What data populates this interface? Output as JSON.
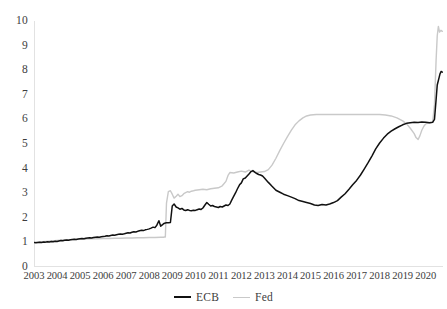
{
  "chart_data": {
    "type": "line",
    "title": "",
    "subtitle": "",
    "xlabel": "",
    "ylabel": "",
    "xlim": [
      2003.0,
      2020.75
    ],
    "ylim": [
      0,
      10
    ],
    "grid": false,
    "legend_position": "bottom-center",
    "y_ticks": [
      0,
      1,
      2,
      3,
      4,
      5,
      6,
      7,
      8,
      9,
      10
    ],
    "y_tick_labels": [
      "0",
      "1",
      "2",
      "3",
      "4",
      "5",
      "6",
      "7",
      "8",
      "9",
      "10"
    ],
    "x_ticks": [
      2003,
      2004,
      2005,
      2006,
      2007,
      2008,
      2009,
      2010,
      2011,
      2012,
      2013,
      2014,
      2015,
      2016,
      2017,
      2018,
      2019,
      2020
    ],
    "x_tick_labels": [
      "2003",
      "2004",
      "2005",
      "2006",
      "2007",
      "2008",
      "2009",
      "2010",
      "2011",
      "2012",
      "2013",
      "2014",
      "2015",
      "2016",
      "2017",
      "2018",
      "2019",
      "2020"
    ],
    "series": [
      {
        "name": "ECB",
        "color": "#111111",
        "line_width": 1.5,
        "x": [
          2003.0,
          2003.08,
          2003.17,
          2003.25,
          2003.33,
          2003.42,
          2003.5,
          2003.58,
          2003.67,
          2003.75,
          2003.83,
          2003.92,
          2004.0,
          2004.08,
          2004.17,
          2004.25,
          2004.33,
          2004.42,
          2004.5,
          2004.58,
          2004.67,
          2004.75,
          2004.83,
          2004.92,
          2005.0,
          2005.08,
          2005.17,
          2005.25,
          2005.33,
          2005.42,
          2005.5,
          2005.58,
          2005.67,
          2005.75,
          2005.83,
          2005.92,
          2006.0,
          2006.08,
          2006.17,
          2006.25,
          2006.33,
          2006.42,
          2006.5,
          2006.58,
          2006.67,
          2006.75,
          2006.83,
          2006.92,
          2007.0,
          2007.08,
          2007.17,
          2007.25,
          2007.33,
          2007.42,
          2007.5,
          2007.58,
          2007.67,
          2007.75,
          2007.83,
          2007.92,
          2008.0,
          2008.08,
          2008.17,
          2008.25,
          2008.33,
          2008.42,
          2008.5,
          2008.58,
          2008.62,
          2008.67,
          2008.7,
          2008.75,
          2008.83,
          2008.92,
          2009.0,
          2009.08,
          2009.17,
          2009.25,
          2009.33,
          2009.42,
          2009.5,
          2009.58,
          2009.67,
          2009.75,
          2009.83,
          2009.92,
          2010.0,
          2010.08,
          2010.17,
          2010.25,
          2010.33,
          2010.42,
          2010.5,
          2010.58,
          2010.67,
          2010.75,
          2010.83,
          2010.92,
          2011.0,
          2011.08,
          2011.17,
          2011.25,
          2011.33,
          2011.42,
          2011.5,
          2011.58,
          2011.67,
          2011.75,
          2011.83,
          2011.92,
          2012.0,
          2012.08,
          2012.17,
          2012.25,
          2012.33,
          2012.42,
          2012.5,
          2012.58,
          2012.67,
          2012.75,
          2012.83,
          2012.92,
          2013.0,
          2013.17,
          2013.33,
          2013.5,
          2013.67,
          2013.83,
          2014.0,
          2014.17,
          2014.33,
          2014.5,
          2014.67,
          2014.83,
          2015.0,
          2015.17,
          2015.33,
          2015.5,
          2015.67,
          2015.83,
          2016.0,
          2016.17,
          2016.33,
          2016.5,
          2016.67,
          2016.83,
          2017.0,
          2017.17,
          2017.33,
          2017.5,
          2017.67,
          2017.83,
          2018.0,
          2018.17,
          2018.33,
          2018.5,
          2018.67,
          2018.83,
          2019.0,
          2019.17,
          2019.33,
          2019.5,
          2019.67,
          2019.83,
          2020.0,
          2020.17,
          2020.3,
          2020.38,
          2020.45,
          2020.5,
          2020.58,
          2020.62,
          2020.67,
          2020.72
        ],
        "values": [
          1.0,
          0.99,
          1.0,
          1.01,
          1.0,
          1.02,
          1.01,
          1.03,
          1.02,
          1.04,
          1.03,
          1.05,
          1.04,
          1.06,
          1.08,
          1.07,
          1.09,
          1.1,
          1.09,
          1.11,
          1.12,
          1.13,
          1.12,
          1.14,
          1.15,
          1.16,
          1.15,
          1.17,
          1.18,
          1.19,
          1.18,
          1.2,
          1.21,
          1.22,
          1.21,
          1.23,
          1.24,
          1.25,
          1.27,
          1.26,
          1.28,
          1.3,
          1.29,
          1.31,
          1.33,
          1.34,
          1.33,
          1.35,
          1.37,
          1.39,
          1.38,
          1.41,
          1.43,
          1.42,
          1.45,
          1.47,
          1.49,
          1.48,
          1.51,
          1.53,
          1.55,
          1.58,
          1.62,
          1.6,
          1.7,
          1.88,
          1.66,
          1.72,
          1.76,
          1.78,
          1.79,
          1.8,
          1.8,
          1.81,
          2.48,
          2.56,
          2.44,
          2.4,
          2.35,
          2.38,
          2.32,
          2.3,
          2.33,
          2.3,
          2.29,
          2.31,
          2.3,
          2.33,
          2.36,
          2.34,
          2.4,
          2.52,
          2.62,
          2.55,
          2.48,
          2.5,
          2.46,
          2.44,
          2.42,
          2.46,
          2.44,
          2.48,
          2.52,
          2.5,
          2.56,
          2.72,
          2.88,
          3.02,
          3.18,
          3.34,
          3.42,
          3.58,
          3.62,
          3.7,
          3.78,
          3.88,
          3.92,
          3.86,
          3.8,
          3.76,
          3.74,
          3.7,
          3.62,
          3.44,
          3.28,
          3.12,
          3.04,
          2.96,
          2.9,
          2.84,
          2.78,
          2.7,
          2.66,
          2.62,
          2.58,
          2.52,
          2.5,
          2.54,
          2.52,
          2.56,
          2.62,
          2.7,
          2.84,
          2.98,
          3.16,
          3.34,
          3.52,
          3.74,
          3.98,
          4.24,
          4.52,
          4.8,
          5.04,
          5.24,
          5.4,
          5.52,
          5.62,
          5.7,
          5.78,
          5.84,
          5.86,
          5.88,
          5.87,
          5.89,
          5.88,
          5.86,
          5.88,
          6.0,
          6.8,
          7.4,
          7.7,
          7.85,
          7.95,
          7.92
        ]
      },
      {
        "name": "Fed",
        "color": "#c9c9c9",
        "line_width": 1.4,
        "x": [
          2003.0,
          2003.25,
          2003.5,
          2003.75,
          2004.0,
          2004.25,
          2004.5,
          2004.75,
          2005.0,
          2005.25,
          2005.5,
          2005.75,
          2006.0,
          2006.25,
          2006.5,
          2006.75,
          2007.0,
          2007.25,
          2007.5,
          2007.75,
          2008.0,
          2008.25,
          2008.5,
          2008.62,
          2008.66,
          2008.7,
          2008.75,
          2008.83,
          2008.92,
          2009.0,
          2009.08,
          2009.17,
          2009.25,
          2009.33,
          2009.42,
          2009.5,
          2009.58,
          2009.67,
          2009.75,
          2009.83,
          2009.92,
          2010.0,
          2010.17,
          2010.33,
          2010.5,
          2010.67,
          2010.83,
          2011.0,
          2011.17,
          2011.33,
          2011.42,
          2011.5,
          2011.67,
          2011.83,
          2012.0,
          2012.17,
          2012.33,
          2012.42,
          2012.5,
          2012.67,
          2012.83,
          2013.0,
          2013.17,
          2013.33,
          2013.5,
          2013.67,
          2013.83,
          2014.0,
          2014.17,
          2014.33,
          2014.5,
          2014.67,
          2014.83,
          2015.0,
          2015.25,
          2015.5,
          2015.75,
          2016.0,
          2016.25,
          2016.5,
          2016.75,
          2017.0,
          2017.25,
          2017.5,
          2017.75,
          2018.0,
          2018.25,
          2018.5,
          2018.75,
          2019.0,
          2019.17,
          2019.33,
          2019.5,
          2019.58,
          2019.67,
          2019.75,
          2019.83,
          2019.92,
          2020.0,
          2020.17,
          2020.3,
          2020.38,
          2020.45,
          2020.5,
          2020.55,
          2020.6,
          2020.66,
          2020.72
        ],
        "values": [
          1.0,
          1.02,
          1.04,
          1.06,
          1.08,
          1.1,
          1.11,
          1.12,
          1.13,
          1.14,
          1.15,
          1.15,
          1.16,
          1.16,
          1.17,
          1.17,
          1.18,
          1.18,
          1.19,
          1.19,
          1.2,
          1.2,
          1.21,
          1.21,
          1.22,
          1.22,
          2.6,
          3.06,
          3.1,
          2.96,
          2.8,
          2.88,
          2.96,
          2.86,
          2.9,
          2.98,
          3.02,
          3.06,
          3.04,
          3.08,
          3.1,
          3.12,
          3.14,
          3.16,
          3.14,
          3.18,
          3.2,
          3.22,
          3.3,
          3.48,
          3.72,
          3.84,
          3.82,
          3.86,
          3.9,
          3.86,
          3.94,
          3.9,
          3.88,
          3.84,
          3.86,
          3.88,
          3.96,
          4.14,
          4.42,
          4.74,
          5.02,
          5.3,
          5.56,
          5.78,
          5.94,
          6.06,
          6.14,
          6.18,
          6.2,
          6.2,
          6.2,
          6.2,
          6.2,
          6.2,
          6.2,
          6.2,
          6.2,
          6.2,
          6.2,
          6.2,
          6.18,
          6.14,
          6.06,
          5.94,
          5.82,
          5.64,
          5.42,
          5.26,
          5.18,
          5.34,
          5.56,
          5.72,
          5.82,
          5.86,
          5.88,
          6.6,
          8.4,
          9.4,
          9.78,
          9.55,
          9.62,
          9.58
        ]
      }
    ]
  },
  "axes": {
    "y_labels": [
      "10",
      "9",
      "8",
      "7",
      "6",
      "5",
      "4",
      "3",
      "2",
      "1",
      "0"
    ],
    "x_labels": [
      "2003",
      "2004",
      "2005",
      "2006",
      "2007",
      "2008",
      "2009",
      "2010",
      "2011",
      "2012",
      "2013",
      "2014",
      "2015",
      "2016",
      "2017",
      "2018",
      "2019",
      "2020"
    ]
  },
  "legend": {
    "items": [
      {
        "label": "ECB",
        "color": "#111111",
        "style": "ecb"
      },
      {
        "label": "Fed",
        "color": "#c9c9c9",
        "style": "fed"
      }
    ]
  },
  "colors": {
    "background": "#ffffff",
    "ecb_line": "#111111",
    "fed_line": "#c9c9c9",
    "axis": "#e2e2e2",
    "text": "#3d3d3d"
  }
}
